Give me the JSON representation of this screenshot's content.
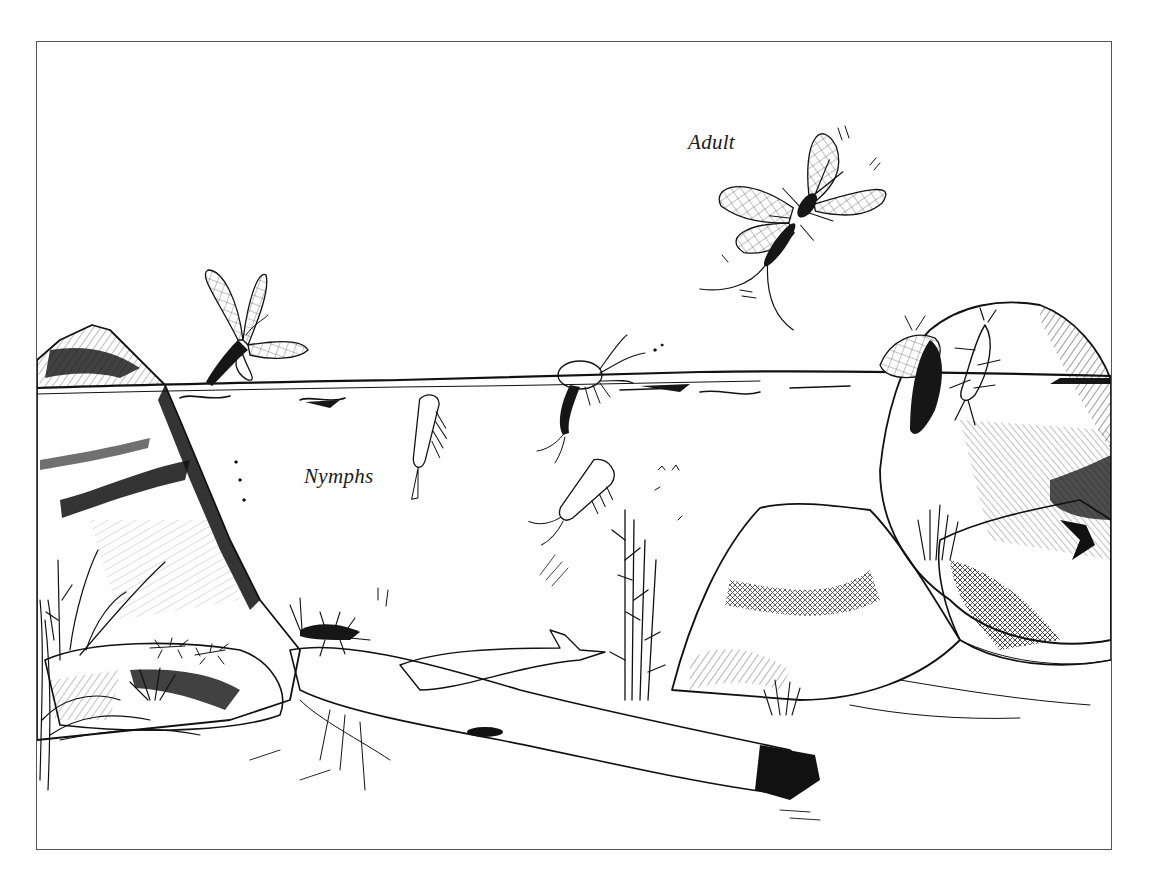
{
  "figure": {
    "style": "black ink pen drawing",
    "border_color": "#555555",
    "ink_color": "#111111",
    "background_color": "#ffffff"
  },
  "labels": {
    "adult": "Adult",
    "nymphs": "Nymphs"
  },
  "elements": [
    {
      "name": "adult-mayfly-flying",
      "description": "winged adult in flight, upper right"
    },
    {
      "name": "mayfly-emerging-left",
      "description": "subimago emerging at water surface, left"
    },
    {
      "name": "nymph-swimming-1",
      "description": "nymph just below surface"
    },
    {
      "name": "nymph-emerging-center",
      "description": "nymph breaking surface, center"
    },
    {
      "name": "nymph-swimming-2",
      "description": "nymph swimming mid-water"
    },
    {
      "name": "mayflies-on-right-rock",
      "description": "adult and nymph on rock, right"
    },
    {
      "name": "nymphs-on-log",
      "description": "nymphs crawling on log / bottom rocks"
    },
    {
      "name": "rocks",
      "description": "boulders left and right"
    },
    {
      "name": "log",
      "description": "sunken log across the bottom"
    },
    {
      "name": "aquatic-plants",
      "description": "water weeds and grasses"
    }
  ]
}
